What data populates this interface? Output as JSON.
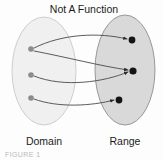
{
  "figure": {
    "title": "Not A Function",
    "caption": "FIGURE 1",
    "background": "#fdfdfd"
  },
  "sets": {
    "domain": {
      "label": "Domain",
      "fill": "#f0f0f0",
      "stroke": "#c8c8c8",
      "cx": 44,
      "cy": 71,
      "rx": 32,
      "ry": 54,
      "label_x": 44,
      "label_y": 145
    },
    "range": {
      "label": "Range",
      "fill": "#d9d9d9",
      "stroke": "#8e8e8e",
      "cx": 125,
      "cy": 70,
      "rx": 30,
      "ry": 55,
      "label_x": 125,
      "label_y": 145
    }
  },
  "nodes": {
    "domain_points": [
      {
        "id": "d1",
        "cx": 31,
        "cy": 49,
        "r": 2.8,
        "fill": "#8c8c8c"
      },
      {
        "id": "d2",
        "cx": 31,
        "cy": 75,
        "r": 2.8,
        "fill": "#8c8c8c"
      },
      {
        "id": "d3",
        "cx": 31,
        "cy": 98,
        "r": 2.8,
        "fill": "#8c8c8c"
      }
    ],
    "range_points": [
      {
        "id": "r1",
        "cx": 132,
        "cy": 40,
        "r": 3.4,
        "fill": "#141414"
      },
      {
        "id": "r2",
        "cx": 133,
        "cy": 71,
        "r": 3.6,
        "fill": "#141414"
      },
      {
        "id": "r3",
        "cx": 119,
        "cy": 100,
        "r": 3.4,
        "fill": "#141414"
      }
    ]
  },
  "edges": {
    "stroke": "#4a4a4a",
    "list": [
      {
        "id": "e1",
        "from": "d1",
        "to": "r1",
        "path": "M 34 48 C 62 34 98 32 127 39"
      },
      {
        "id": "e2",
        "from": "d1",
        "to": "r2",
        "path": "M 34 51 C 66 57 100 66 128 70"
      },
      {
        "id": "e3",
        "from": "d2",
        "to": "r2",
        "path": "M 34 76 C 64 88 104 82 128 72"
      },
      {
        "id": "e4",
        "from": "d3",
        "to": "r3",
        "path": "M 34 99 C 58 108 92 106 114 100"
      }
    ]
  },
  "relation_data": {
    "type": "mapping-diagram",
    "is_function": false,
    "reason": "one domain element maps to two range elements",
    "pairs": [
      [
        "d1",
        "r1"
      ],
      [
        "d1",
        "r2"
      ],
      [
        "d2",
        "r2"
      ],
      [
        "d3",
        "r3"
      ]
    ]
  }
}
